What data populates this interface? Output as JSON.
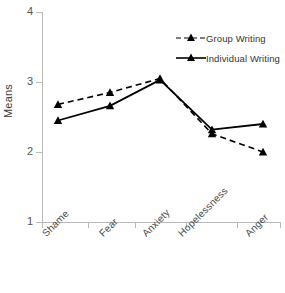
{
  "chart_data": {
    "type": "line",
    "title": "",
    "xlabel": "",
    "ylabel": "Means",
    "categories": [
      "Shame",
      "Fear",
      "Anxiety",
      "Hopelessness",
      "Anger"
    ],
    "ylim": [
      1,
      4
    ],
    "yticks": [
      1,
      2,
      3,
      4
    ],
    "ytick_labels": [
      "1",
      "2",
      "3",
      "4"
    ],
    "grid": false,
    "legend_position": "top-right",
    "series": [
      {
        "name": "Group Writing",
        "style": "dashed",
        "marker": "triangle",
        "color": "#000000",
        "values": [
          2.68,
          2.85,
          3.05,
          2.26,
          2.0
        ]
      },
      {
        "name": "Individual Writing",
        "style": "solid",
        "marker": "triangle",
        "color": "#000000",
        "values": [
          2.45,
          2.66,
          3.03,
          2.32,
          2.4
        ]
      }
    ]
  },
  "axes": {
    "y_title": "Means",
    "y_tick_1": "1",
    "y_tick_2": "2",
    "y_tick_3": "3",
    "y_tick_4": "4",
    "x_label_0": "Shame",
    "x_label_1": "Fear",
    "x_label_2": "Anxiety",
    "x_label_3": "Hopelessness",
    "x_label_4": "Anger"
  },
  "legend": {
    "entry_0": "Group Writing",
    "entry_1": "Individual Writing"
  }
}
